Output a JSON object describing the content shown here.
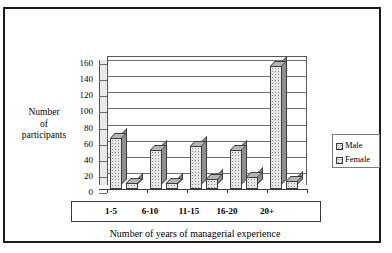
{
  "chart_data": {
    "type": "bar",
    "title": "",
    "subtitle": "",
    "xlabel": "Number of years of managerial experience",
    "ylabel": "Number of participants",
    "categories": [
      "1-5",
      "6-10",
      "11-15",
      "16-20",
      "20+"
    ],
    "series": [
      {
        "name": "Male",
        "values": [
          63,
          48,
          53,
          48,
          152
        ]
      },
      {
        "name": "Female",
        "values": [
          8,
          8,
          12,
          15,
          10
        ]
      }
    ],
    "ylim": [
      0,
      160
    ],
    "ytick_labels": [
      "160",
      "140",
      "120",
      "100",
      "80",
      "60",
      "40",
      "20",
      "0"
    ],
    "ytick_values": [
      160,
      140,
      120,
      100,
      80,
      60,
      40,
      20,
      0
    ],
    "ytick_step": 20,
    "grid": true,
    "legend_position": "right",
    "legend_entries": [
      "Male",
      "Female"
    ],
    "style": "3d-clustered-column",
    "colors": {
      "bar_face": "#e6e6e6",
      "bar_top": "#b4b4b4",
      "bar_side": "#8f8f8f",
      "bar_outline": "#3d3d3d",
      "gridline": "#6d6d6d",
      "axis": "#3a3a3a",
      "frame": "#1a1a1a",
      "background": "#ffffff",
      "text": "#000000"
    }
  },
  "ylabel_lines": [
    "Number",
    "of",
    "participants"
  ]
}
